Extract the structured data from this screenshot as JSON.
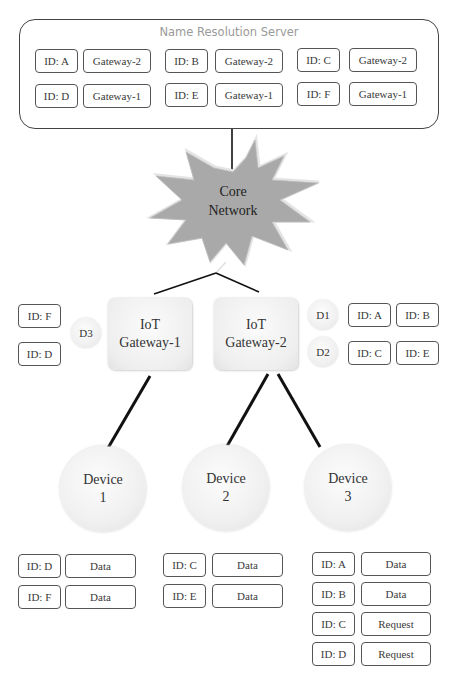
{
  "name_resolution_server": {
    "title": "Name Resolution Server",
    "entries": [
      {
        "id": "ID: A",
        "gateway": "Gateway-2"
      },
      {
        "id": "ID: B",
        "gateway": "Gateway-2"
      },
      {
        "id": "ID: C",
        "gateway": "Gateway-2"
      },
      {
        "id": "ID: D",
        "gateway": "Gateway-1"
      },
      {
        "id": "ID: E",
        "gateway": "Gateway-1"
      },
      {
        "id": "ID: F",
        "gateway": "Gateway-1"
      }
    ]
  },
  "core_network": {
    "line1": "Core",
    "line2": "Network",
    "fill_color": "#a9a9a9"
  },
  "gateways": [
    {
      "line1": "IoT",
      "line2": "Gateway-1",
      "device_groups": [
        {
          "label": "D3",
          "ids": [
            "ID: F",
            "ID: D"
          ]
        }
      ]
    },
    {
      "line1": "IoT",
      "line2": "Gateway-2",
      "device_groups": [
        {
          "label": "D1",
          "ids": [
            "ID: A",
            "ID: B"
          ]
        },
        {
          "label": "D2",
          "ids": [
            "ID: C",
            "ID: E"
          ]
        }
      ]
    }
  ],
  "devices": [
    {
      "line1": "Device",
      "line2": "1",
      "table": [
        {
          "id": "ID: D",
          "type": "Data"
        },
        {
          "id": "ID: F",
          "type": "Data"
        }
      ]
    },
    {
      "line1": "Device",
      "line2": "2",
      "table": [
        {
          "id": "ID: C",
          "type": "Data"
        },
        {
          "id": "ID: E",
          "type": "Data"
        }
      ]
    },
    {
      "line1": "Device",
      "line2": "3",
      "table": [
        {
          "id": "ID: A",
          "type": "Data"
        },
        {
          "id": "ID: B",
          "type": "Data"
        },
        {
          "id": "ID: C",
          "type": "Request"
        },
        {
          "id": "ID: D",
          "type": "Request"
        }
      ]
    }
  ]
}
